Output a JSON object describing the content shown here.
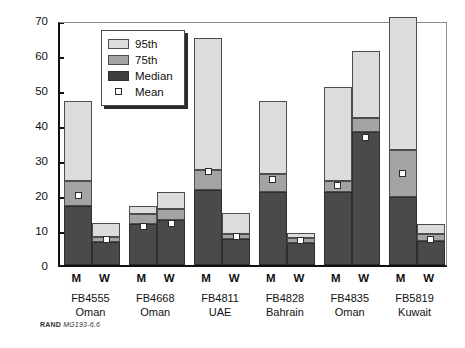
{
  "figure": {
    "footer_brand": "RAND",
    "footer_code": "MG193-6.6"
  },
  "legend": {
    "position": "inside-top-left",
    "items": [
      {
        "key": "p95",
        "label": "95th",
        "color": "#dcdcdc"
      },
      {
        "key": "p75",
        "label": "75th",
        "color": "#a3a3a3"
      },
      {
        "key": "med",
        "label": "Median",
        "color": "#3d3d3d"
      },
      {
        "key": "mean",
        "label": "Mean",
        "color": "#ffffff"
      }
    ]
  },
  "chart_data": {
    "type": "bar",
    "title": "",
    "subtitle": "",
    "xlabel": "",
    "ylabel": "Days",
    "ylim": [
      0,
      70
    ],
    "ytick_labels": [
      "0",
      "10",
      "20",
      "30",
      "40",
      "50",
      "60",
      "70"
    ],
    "yticks": [
      0,
      10,
      20,
      30,
      40,
      50,
      60,
      70
    ],
    "grid": false,
    "stacked": true,
    "legend_position": "inside-top-left",
    "groups": [
      {
        "id": "FB4555",
        "country": "Oman",
        "bars": [
          {
            "label": "M",
            "median": 17.0,
            "p75": 24.0,
            "p95": 47.0,
            "mean": 19.8
          },
          {
            "label": "W",
            "median": 6.5,
            "p75": 8.0,
            "p95": 12.0,
            "mean": 7.3
          }
        ]
      },
      {
        "id": "FB4668",
        "country": "Oman",
        "bars": [
          {
            "label": "M",
            "median": 11.7,
            "p75": 14.5,
            "p95": 17.0,
            "mean": 11.0
          },
          {
            "label": "W",
            "median": 13.0,
            "p75": 16.0,
            "p95": 21.0,
            "mean": 12.0
          }
        ]
      },
      {
        "id": "FB4811",
        "country": "UAE",
        "bars": [
          {
            "label": "M",
            "median": 21.5,
            "p75": 27.2,
            "p95": 64.8,
            "mean": 26.6
          },
          {
            "label": "W",
            "median": 7.4,
            "p75": 9.0,
            "p95": 14.8,
            "mean": 8.1
          }
        ]
      },
      {
        "id": "FB4828",
        "country": "Bahrain",
        "bars": [
          {
            "label": "M",
            "median": 21.0,
            "p75": 26.0,
            "p95": 46.8,
            "mean": 24.4
          },
          {
            "label": "W",
            "median": 6.4,
            "p75": 7.6,
            "p95": 9.2,
            "mean": 7.0
          }
        ]
      },
      {
        "id": "FB4835",
        "country": "Oman",
        "bars": [
          {
            "label": "M",
            "median": 20.8,
            "p75": 24.0,
            "p95": 50.8,
            "mean": 22.6
          },
          {
            "label": "W",
            "median": 38.0,
            "p75": 42.0,
            "p95": 61.2,
            "mean": 36.4
          }
        ]
      },
      {
        "id": "FB5819",
        "country": "Kuwait",
        "bars": [
          {
            "label": "M",
            "median": 19.4,
            "p75": 32.8,
            "p95": 71.0,
            "mean": 26.2
          },
          {
            "label": "W",
            "median": 7.0,
            "p75": 8.8,
            "p95": 11.8,
            "mean": 7.4
          }
        ]
      }
    ]
  }
}
